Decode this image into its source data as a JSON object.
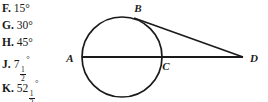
{
  "choices": [
    {
      "letter": "F.",
      "value": "15",
      "degree": "°",
      "fraction": null
    },
    {
      "letter": "G.",
      "value": "30",
      "degree": "°",
      "fraction": null
    },
    {
      "letter": "H.",
      "value": "45",
      "degree": "°",
      "fraction": null
    },
    {
      "letter": "J.",
      "value": "7",
      "degree": "°",
      "fraction": {
        "num": "1",
        "den": "2"
      }
    },
    {
      "letter": "K.",
      "value": "52",
      "degree": "°",
      "fraction": {
        "num": "1",
        "den": "2"
      }
    }
  ],
  "figure": {
    "labels": {
      "a": "A",
      "b": "B",
      "c": "C",
      "d": "D"
    },
    "stroke_color": "#1a1a1a"
  }
}
